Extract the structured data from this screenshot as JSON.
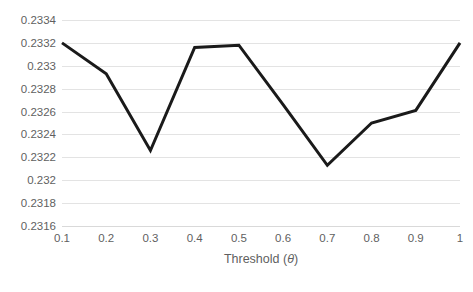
{
  "chart_data": {
    "type": "line",
    "title": "",
    "subtitle": "",
    "xlabel": "Threshold (θ)",
    "xlabel_prefix": "Threshold (",
    "xlabel_symbol": "θ",
    "xlabel_suffix": ")",
    "ylabel": "",
    "x": [
      0.1,
      0.2,
      0.3,
      0.4,
      0.5,
      0.6,
      0.7,
      0.8,
      0.9,
      1
    ],
    "xticklabels": [
      "0.1",
      "0.2",
      "0.3",
      "0.4",
      "0.5",
      "0.6",
      "0.7",
      "0.8",
      "0.9",
      "1"
    ],
    "values": [
      0.2332,
      0.23293,
      0.23226,
      0.23316,
      0.23318,
      0.23266,
      0.23213,
      0.2325,
      0.23261,
      0.2332
    ],
    "yticks": [
      0.2316,
      0.2318,
      0.232,
      0.2322,
      0.2324,
      0.2326,
      0.2328,
      0.233,
      0.2332,
      0.2334
    ],
    "yticklabels": [
      "0.2316",
      "0.2318",
      "0.232",
      "0.2322",
      "0.2324",
      "0.2326",
      "0.2328",
      "0.233",
      "0.2332",
      "0.2334"
    ],
    "ylim": [
      0.2316,
      0.2334
    ],
    "xlim": [
      0.1,
      1
    ],
    "grid": "horizontal",
    "legend": "none",
    "series": [
      {
        "name": "value",
        "color": "#1a1a1a",
        "line_width": 3,
        "markers": "none",
        "values": [
          0.2332,
          0.23293,
          0.23226,
          0.23316,
          0.23318,
          0.23266,
          0.23213,
          0.2325,
          0.23261,
          0.2332
        ]
      }
    ],
    "colors": {
      "series_line": "#1a1a1a",
      "gridline": "#e3e3e3",
      "axis_line": "#d9d9d9",
      "tick_label": "#5f5f5f",
      "background": "#ffffff"
    }
  }
}
